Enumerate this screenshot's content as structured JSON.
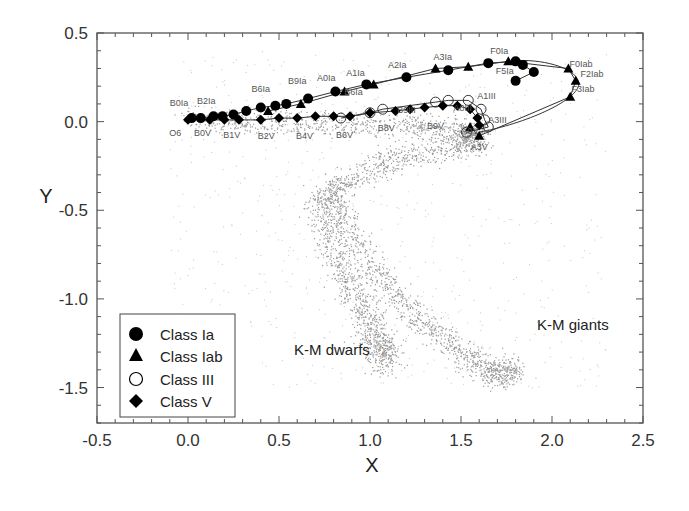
{
  "chart_data": {
    "type": "scatter",
    "title": "",
    "xlabel": "X",
    "ylabel": "Y",
    "xlim": [
      -0.5,
      2.5
    ],
    "ylim": [
      -1.7,
      0.5
    ],
    "xticks": [
      "-0.5",
      "0.0",
      "0.5",
      "1.0",
      "1.5",
      "2.0",
      "2.5"
    ],
    "yticks": [
      "0.5",
      "0.0",
      "-0.5",
      "-1.0",
      "-1.5"
    ],
    "grid": false,
    "legend_position": "lower-left",
    "legend": [
      "Class Ia",
      "Class Iab",
      "Class III",
      "Class V"
    ],
    "annotations": [
      "K-M dwarfs",
      "K-M giants"
    ],
    "spectral_labels": [
      {
        "text": "B0Ia",
        "x": -0.05,
        "y": 0.09
      },
      {
        "text": "B2Ia",
        "x": 0.1,
        "y": 0.1
      },
      {
        "text": "B6Ia",
        "x": 0.4,
        "y": 0.17
      },
      {
        "text": "B9Ia",
        "x": 0.6,
        "y": 0.21
      },
      {
        "text": "A0Ia",
        "x": 0.76,
        "y": 0.23
      },
      {
        "text": "A1Ia",
        "x": 0.92,
        "y": 0.26
      },
      {
        "text": "A2Ia",
        "x": 1.15,
        "y": 0.3
      },
      {
        "text": "A3Ia",
        "x": 1.4,
        "y": 0.35
      },
      {
        "text": "F0Ia",
        "x": 1.71,
        "y": 0.38
      },
      {
        "text": "F5Ia",
        "x": 1.74,
        "y": 0.27
      },
      {
        "text": "F0Iab",
        "x": 2.16,
        "y": 0.31
      },
      {
        "text": "F2Iab",
        "x": 2.22,
        "y": 0.25
      },
      {
        "text": "F3Iab",
        "x": 2.17,
        "y": 0.17
      },
      {
        "text": "B6Ia",
        "x": 0.91,
        "y": 0.15
      },
      {
        "text": "B9III",
        "x": 1.2,
        "y": 0.05
      },
      {
        "text": "A0III",
        "x": 1.51,
        "y": 0.06
      },
      {
        "text": "A1III",
        "x": 1.64,
        "y": 0.13
      },
      {
        "text": "A3III",
        "x": 1.7,
        "y": -0.01
      },
      {
        "text": "A0V",
        "x": 1.55,
        "y": -0.07
      },
      {
        "text": "A3V",
        "x": 1.6,
        "y": -0.16
      },
      {
        "text": "O6",
        "x": -0.07,
        "y": -0.08
      },
      {
        "text": "B0V",
        "x": 0.08,
        "y": -0.08
      },
      {
        "text": "B1V",
        "x": 0.24,
        "y": -0.09
      },
      {
        "text": "B2V",
        "x": 0.43,
        "y": -0.1
      },
      {
        "text": "B4V",
        "x": 0.64,
        "y": -0.1
      },
      {
        "text": "B6V",
        "x": 0.86,
        "y": -0.09
      },
      {
        "text": "B8V",
        "x": 1.09,
        "y": -0.05
      },
      {
        "text": "B9V",
        "x": 1.36,
        "y": -0.04
      }
    ],
    "series": [
      {
        "name": "Class Ia",
        "marker": "filled-circle",
        "points": [
          [
            0.02,
            0.02
          ],
          [
            0.07,
            0.02
          ],
          [
            0.14,
            0.03
          ],
          [
            0.19,
            0.03
          ],
          [
            0.25,
            0.04
          ],
          [
            0.32,
            0.06
          ],
          [
            0.4,
            0.08
          ],
          [
            0.48,
            0.09
          ],
          [
            0.54,
            0.1
          ],
          [
            0.66,
            0.13
          ],
          [
            0.81,
            0.17
          ],
          [
            0.98,
            0.21
          ],
          [
            1.2,
            0.25
          ],
          [
            1.43,
            0.29
          ],
          [
            1.65,
            0.33
          ],
          [
            1.8,
            0.34
          ],
          [
            1.84,
            0.32
          ],
          [
            1.9,
            0.28
          ],
          [
            1.8,
            0.23
          ]
        ]
      },
      {
        "name": "Class Iab",
        "marker": "filled-triangle",
        "points": [
          [
            0.44,
            0.06
          ],
          [
            0.62,
            0.1
          ],
          [
            0.86,
            0.17
          ],
          [
            1.02,
            0.21
          ],
          [
            1.36,
            0.3
          ],
          [
            1.54,
            0.31
          ],
          [
            1.76,
            0.34
          ],
          [
            2.09,
            0.3
          ],
          [
            2.13,
            0.23
          ],
          [
            2.1,
            0.14
          ],
          [
            1.6,
            -0.08
          ],
          [
            1.55,
            -0.03
          ]
        ]
      },
      {
        "name": "Class III",
        "marker": "open-circle",
        "points": [
          [
            0.84,
            0.02
          ],
          [
            1.0,
            0.05
          ],
          [
            1.07,
            0.07
          ],
          [
            1.36,
            0.11
          ],
          [
            1.43,
            0.12
          ],
          [
            1.54,
            0.12
          ],
          [
            1.61,
            0.07
          ],
          [
            1.63,
            0.01
          ],
          [
            1.65,
            -0.03
          ],
          [
            1.53,
            -0.06
          ]
        ]
      },
      {
        "name": "Class V",
        "marker": "filled-diamond",
        "points": [
          [
            0.0,
            0.01
          ],
          [
            0.12,
            0.01
          ],
          [
            0.2,
            0.01
          ],
          [
            0.28,
            0.01
          ],
          [
            0.4,
            0.01
          ],
          [
            0.5,
            0.02
          ],
          [
            0.6,
            0.02
          ],
          [
            0.7,
            0.03
          ],
          [
            0.8,
            0.03
          ],
          [
            0.89,
            0.03
          ],
          [
            1.0,
            0.05
          ],
          [
            1.14,
            0.06
          ],
          [
            1.22,
            0.07
          ],
          [
            1.3,
            0.08
          ],
          [
            1.4,
            0.09
          ],
          [
            1.48,
            0.09
          ],
          [
            1.55,
            0.07
          ],
          [
            1.59,
            0.02
          ],
          [
            1.6,
            -0.02
          ]
        ]
      }
    ],
    "background_cloud": {
      "description": "grey point cloud of field stars",
      "color": "#9a9a9a"
    }
  },
  "colors": {
    "marker": "#000000",
    "cloud": "#9a9a9a",
    "axis": "#444444",
    "text": "#222222"
  }
}
